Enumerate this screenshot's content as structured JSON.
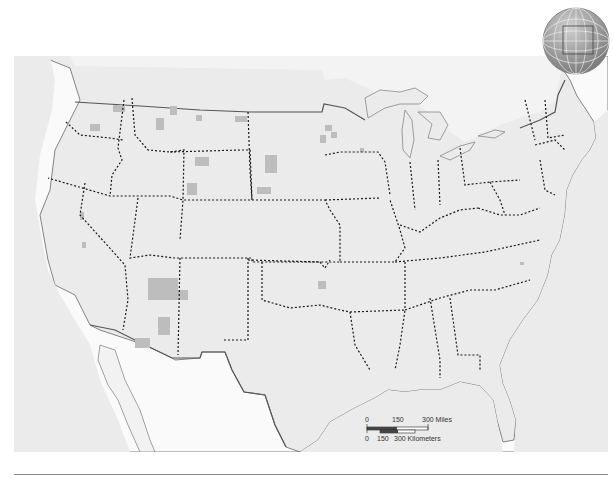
{
  "map": {
    "title": "Contiguous United States",
    "colors": {
      "water": "#ebebeb",
      "land": "#fafafa",
      "reservation": "#bdbdbd",
      "border_line": "#555555",
      "state_line": "#1a1a1a",
      "globe_fill": "#9a9a9a",
      "globe_grid": "#e8e8e8"
    },
    "legend": {
      "shaded_areas": "gray-shaded-lands"
    },
    "scale_bar": {
      "miles_ticks": [
        "0",
        "150",
        "300 Miles"
      ],
      "km_ticks": [
        "0",
        "150",
        "300 Kilometers"
      ]
    },
    "locator_globe": {
      "icon": "globe-icon",
      "highlight": "north-america-extent-box"
    }
  }
}
